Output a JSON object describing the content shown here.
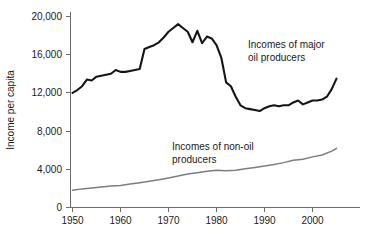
{
  "chart_data": {
    "type": "line",
    "title": "",
    "xlabel": "",
    "ylabel": "Income per capita",
    "xlim": [
      1950,
      2006
    ],
    "ylim": [
      0,
      20000
    ],
    "grid": false,
    "legend_position": "inline-annotations",
    "x_ticks": [
      "1950",
      "1960",
      "1970",
      "1980",
      "1990",
      "2000"
    ],
    "x_tick_values": [
      1950,
      1960,
      1970,
      1980,
      1990,
      2000
    ],
    "y_ticks": [
      "0",
      "4,000",
      "8,000",
      "12,000",
      "16,000",
      "20,000"
    ],
    "y_tick_values": [
      0,
      4000,
      8000,
      12000,
      16000,
      20000
    ],
    "annotations": [
      {
        "id": "oil-annotation",
        "line1": "Incomes of major",
        "line2": "oil producers",
        "x": 248,
        "y": 48
      },
      {
        "id": "nonoil-annotation",
        "line1": "Incomes of non-oil",
        "line2": "producers",
        "x": 172,
        "y": 150
      }
    ],
    "series": [
      {
        "name": "Incomes of major oil producers",
        "color": "#151515",
        "x": [
          1950,
          1951,
          1952,
          1953,
          1954,
          1955,
          1956,
          1957,
          1958,
          1959,
          1960,
          1961,
          1962,
          1963,
          1964,
          1965,
          1966,
          1967,
          1968,
          1969,
          1970,
          1971,
          1972,
          1973,
          1974,
          1975,
          1976,
          1977,
          1978,
          1979,
          1980,
          1981,
          1982,
          1983,
          1984,
          1985,
          1986,
          1987,
          1988,
          1989,
          1990,
          1991,
          1992,
          1993,
          1994,
          1995,
          1996,
          1997,
          1998,
          1999,
          2000,
          2001,
          2002,
          2003,
          2004,
          2005
        ],
        "values": [
          12000,
          12300,
          12700,
          13400,
          13300,
          13700,
          13800,
          13900,
          14000,
          14400,
          14200,
          14200,
          14300,
          14400,
          14500,
          16600,
          16800,
          17000,
          17300,
          17800,
          18400,
          18800,
          19200,
          18800,
          18400,
          17300,
          18500,
          17200,
          17900,
          17700,
          17000,
          15700,
          13100,
          12700,
          11600,
          10700,
          10400,
          10300,
          10200,
          10100,
          10400,
          10600,
          10700,
          10600,
          10700,
          10700,
          11000,
          11200,
          10800,
          11000,
          11200,
          11200,
          11300,
          11600,
          12400,
          13500
        ]
      },
      {
        "name": "Incomes of non-oil producers",
        "color": "#7d7d7d",
        "x": [
          1950,
          1952,
          1954,
          1956,
          1958,
          1960,
          1962,
          1964,
          1966,
          1968,
          1970,
          1972,
          1974,
          1976,
          1978,
          1980,
          1982,
          1984,
          1986,
          1988,
          1990,
          1992,
          1994,
          1996,
          1998,
          2000,
          2002,
          2004,
          2005
        ],
        "values": [
          1800,
          1950,
          2050,
          2150,
          2250,
          2300,
          2450,
          2600,
          2750,
          2900,
          3100,
          3300,
          3500,
          3650,
          3800,
          3900,
          3850,
          3900,
          4050,
          4200,
          4350,
          4500,
          4700,
          4950,
          5050,
          5300,
          5500,
          5900,
          6200
        ]
      }
    ]
  },
  "axis": {
    "y_title": "Income per capita"
  }
}
